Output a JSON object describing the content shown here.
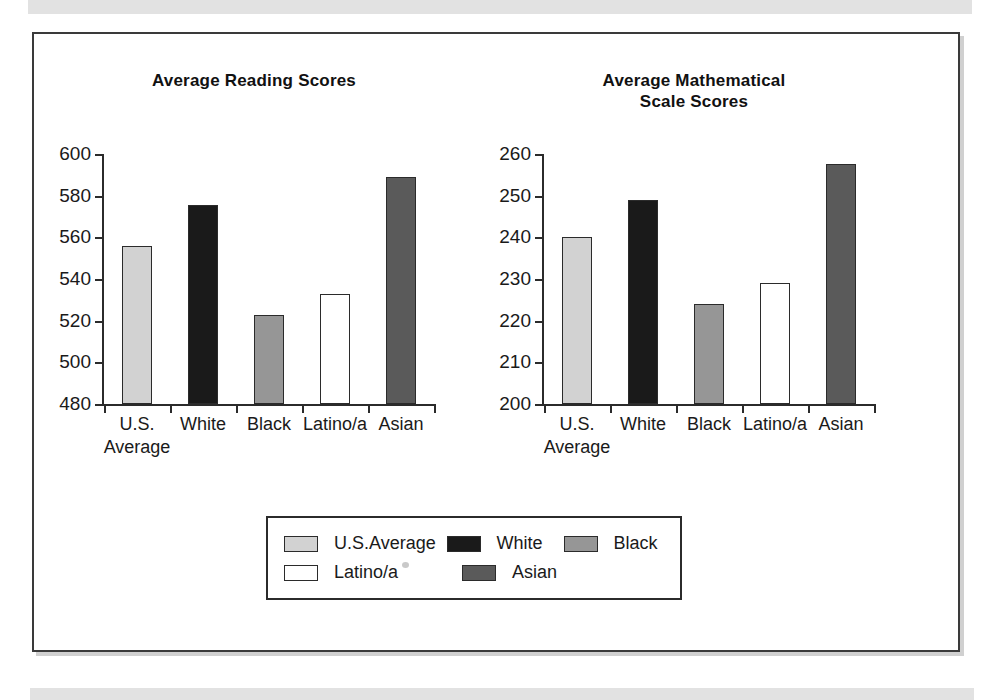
{
  "figure": {
    "series_colors": {
      "U.S.Average": "#d2d2d2",
      "White": "#1a1a1a",
      "Black": "#969696",
      "Latino/a": "#ffffff",
      "Asian": "#5a5a5a"
    },
    "axis_color": "#2b2b2b",
    "frame_color": "#3a3a3a",
    "background": "#ffffff"
  },
  "legend": {
    "position": "bottom-center",
    "entries": [
      {
        "label": "U.S.Average",
        "color": "#d2d2d2"
      },
      {
        "label": "White",
        "color": "#1a1a1a"
      },
      {
        "label": "Black",
        "color": "#969696"
      },
      {
        "label": "Latino/a",
        "color": "#ffffff"
      },
      {
        "label": "Asian",
        "color": "#5a5a5a"
      }
    ]
  },
  "chart_data": [
    {
      "type": "bar",
      "title": "Average Reading Scores",
      "xlabel": "",
      "ylabel": "",
      "categories": [
        "U.S.\nAverage",
        "White",
        "Black",
        "Latino/a",
        "Asian"
      ],
      "category_names": [
        "U.S. Average",
        "White",
        "Black",
        "Latino/a",
        "Asian"
      ],
      "values": [
        556,
        575.6,
        522.5,
        533,
        589
      ],
      "ylim": [
        480,
        600
      ],
      "yticks": [
        480,
        500,
        520,
        540,
        560,
        580,
        600
      ],
      "ytick_labels": [
        "480",
        "500",
        "520",
        "540",
        "560",
        "580",
        "600"
      ],
      "grid": false,
      "bar_colors": [
        "#d2d2d2",
        "#1a1a1a",
        "#969696",
        "#ffffff",
        "#5a5a5a"
      ]
    },
    {
      "type": "bar",
      "title": "Average Mathematical\nScale Scores",
      "xlabel": "",
      "ylabel": "",
      "categories": [
        "U.S.\nAverage",
        "White",
        "Black",
        "Latino/a",
        "Asian"
      ],
      "category_names": [
        "U.S. Average",
        "White",
        "Black",
        "Latino/a",
        "Asian"
      ],
      "values": [
        240,
        249,
        224,
        229,
        257.5
      ],
      "ylim": [
        200,
        260
      ],
      "yticks": [
        200,
        210,
        220,
        230,
        240,
        250,
        260
      ],
      "ytick_labels": [
        "200",
        "210",
        "220",
        "230",
        "240",
        "250",
        "260"
      ],
      "grid": false,
      "bar_colors": [
        "#d2d2d2",
        "#1a1a1a",
        "#969696",
        "#ffffff",
        "#5a5a5a"
      ]
    }
  ]
}
